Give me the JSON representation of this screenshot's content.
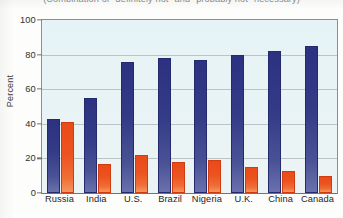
{
  "chart_data": {
    "type": "bar",
    "title": "(Combination of \"definitely not\" and \"probably not\" necessary)",
    "xlabel": "",
    "ylabel": "Percent",
    "ylim": [
      0,
      100
    ],
    "yticks": [
      0,
      20,
      40,
      60,
      80,
      100
    ],
    "ytick_labels": [
      "0",
      "20",
      "40",
      "60",
      "80",
      "100"
    ],
    "grid": true,
    "legend": "none",
    "categories": [
      "Russia",
      "India",
      "U.S.",
      "Brazil",
      "Nigeria",
      "U.K.",
      "China",
      "Canada"
    ],
    "series": [
      {
        "name": "series-1",
        "color": "#2c3280",
        "values": [
          43,
          55,
          76,
          78,
          77,
          80,
          82,
          85
        ]
      },
      {
        "name": "series-2",
        "color": "#ea4a18",
        "values": [
          41,
          17,
          22,
          18,
          19,
          15,
          13,
          10
        ]
      }
    ]
  },
  "colors": {
    "series_1": "#2c3280",
    "series_2": "#ea4a18",
    "plot_background": "#e7f3f6",
    "gridline": "#b9c4c7",
    "axis": "#6f7477"
  }
}
